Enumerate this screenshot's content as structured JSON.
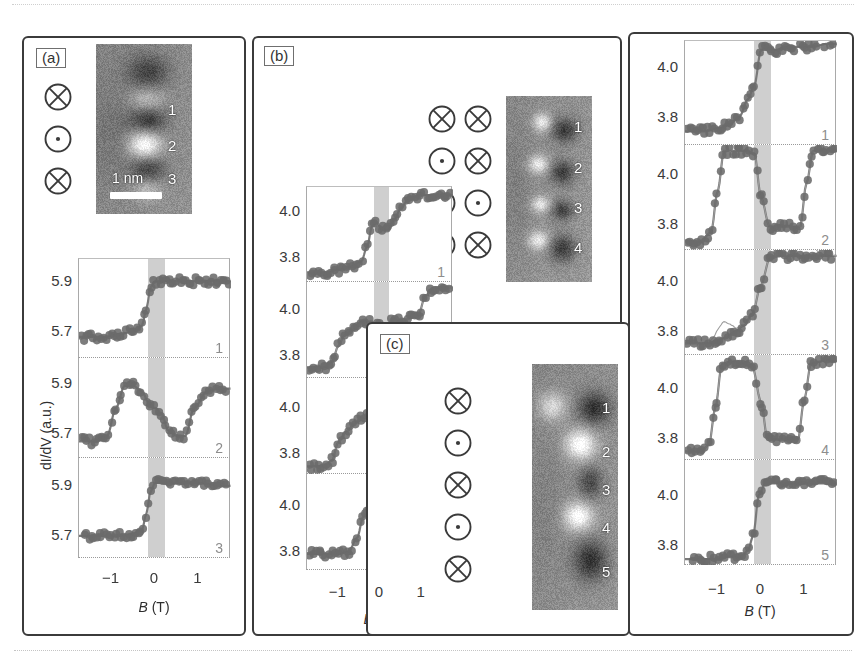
{
  "figure": {
    "background": "#ffffff",
    "data_color": "#6b6b6b",
    "band_color": "#cfcfcf",
    "curve_color": "#7a7a7a",
    "frame_color": "#3b3b3b"
  },
  "panels": [
    {
      "id": "a",
      "label": "(a)",
      "spins": [
        [
          "cross"
        ],
        [
          "dot"
        ],
        [
          "cross"
        ]
      ],
      "stm": {
        "numbers": [
          "1",
          "2",
          "3"
        ],
        "scalebar_label": "1 nm"
      },
      "axis": {
        "ylabel": "dI/dV (a.u.)",
        "yticks": [
          "5.9",
          "5.7"
        ],
        "xticks": [
          "-1",
          "0",
          "1"
        ],
        "xlabel_sym": "B",
        "xlabel_unit": "(T)"
      },
      "subplots": [
        {
          "number": "1"
        },
        {
          "number": "2"
        },
        {
          "number": "3"
        }
      ]
    },
    {
      "id": "b",
      "label": "(b)",
      "spins": [
        [
          "cross",
          "cross"
        ],
        [
          "dot",
          "cross"
        ],
        [
          "cross",
          "dot"
        ],
        [
          "cross",
          "cross"
        ]
      ],
      "stm": {
        "numbers": [
          "1",
          "2",
          "3",
          "4"
        ],
        "scalebar_label": ""
      },
      "axis": {
        "ylabel": "",
        "yticks": [
          "4.0",
          "3.8"
        ],
        "xticks": [
          "-1",
          "0",
          "1"
        ],
        "xlabel_sym": "B",
        "xlabel_unit": "(T)"
      },
      "subplots": [
        {
          "number": "1"
        },
        {
          "number": "2"
        },
        {
          "number": "3"
        },
        {
          "number": "4"
        }
      ]
    },
    {
      "id": "c",
      "label": "(c)",
      "spins": [
        [
          "cross"
        ],
        [
          "dot"
        ],
        [
          "cross"
        ],
        [
          "dot"
        ],
        [
          "cross"
        ]
      ],
      "stm": {
        "numbers": [
          "1",
          "2",
          "3",
          "4",
          "5"
        ],
        "scalebar_label": ""
      },
      "axis": {
        "ylabel": "",
        "yticks": [
          "4.0",
          "3.8"
        ],
        "xticks": [
          "-1",
          "0",
          "1"
        ],
        "xlabel_sym": "B",
        "xlabel_unit": "(T)"
      },
      "subplots": [
        {
          "number": "1"
        },
        {
          "number": "2"
        },
        {
          "number": "3"
        },
        {
          "number": "4"
        },
        {
          "number": "5"
        }
      ]
    }
  ],
  "chart_data": {
    "type": "scatter",
    "title": "",
    "xlabel": "B (T)",
    "ylabel": "dI/dV (a.u.)",
    "xlim": [
      -1.75,
      1.75
    ],
    "ylim_a": [
      5.62,
      5.98
    ],
    "ylim_bc": [
      3.72,
      4.08
    ],
    "grid": false,
    "legend": "none",
    "shaded_band_T": [
      -0.15,
      0.22
    ],
    "panels": [
      {
        "panel": "a",
        "yticks": [
          5.7,
          5.9
        ],
        "xticks": [
          -1,
          0,
          1
        ],
        "curves": [
          {
            "site": "1",
            "type": "single-step",
            "x": [
              -1.75,
              -1.2,
              -0.8,
              -0.45,
              -0.3,
              -0.2,
              -0.1,
              0.0,
              0.2,
              0.6,
              1.0,
              1.5,
              1.75
            ],
            "y": [
              5.7,
              5.7,
              5.71,
              5.72,
              5.74,
              5.8,
              5.88,
              5.9,
              5.9,
              5.9,
              5.9,
              5.9,
              5.9
            ]
          },
          {
            "site": "2",
            "type": "double-switch",
            "x": [
              -1.75,
              -1.4,
              -1.1,
              -0.9,
              -0.7,
              -0.5,
              -0.3,
              -0.15,
              0.0,
              0.15,
              0.3,
              0.5,
              0.7,
              0.9,
              1.2,
              1.5,
              1.75
            ],
            "y": [
              5.68,
              5.68,
              5.7,
              5.8,
              5.88,
              5.88,
              5.86,
              5.82,
              5.8,
              5.78,
              5.72,
              5.7,
              5.7,
              5.8,
              5.86,
              5.87,
              5.87
            ]
          },
          {
            "site": "3",
            "type": "single-step",
            "x": [
              -1.75,
              -1.2,
              -0.8,
              -0.45,
              -0.3,
              -0.2,
              -0.1,
              0.0,
              0.2,
              0.6,
              1.0,
              1.5,
              1.75
            ],
            "y": [
              5.7,
              5.7,
              5.7,
              5.71,
              5.72,
              5.78,
              5.86,
              5.89,
              5.89,
              5.89,
              5.89,
              5.88,
              5.88
            ]
          }
        ]
      },
      {
        "panel": "b",
        "yticks": [
          3.8,
          4.0
        ],
        "xticks": [
          -1,
          0,
          1
        ],
        "curves": [
          {
            "site": "1",
            "type": "two-step",
            "x": [
              -1.75,
              -1.3,
              -1.0,
              -0.7,
              -0.45,
              -0.3,
              -0.2,
              -0.1,
              0.05,
              0.2,
              0.35,
              0.5,
              0.7,
              1.0,
              1.4,
              1.75
            ],
            "y": [
              3.76,
              3.76,
              3.77,
              3.78,
              3.8,
              3.86,
              3.93,
              3.95,
              3.92,
              3.92,
              3.96,
              4.0,
              4.04,
              4.05,
              4.05,
              4.05
            ]
          },
          {
            "site": "2",
            "type": "three-step",
            "x": [
              -1.75,
              -1.35,
              -1.15,
              -1.0,
              -0.85,
              -0.65,
              -0.45,
              -0.3,
              -0.1,
              0.1,
              0.3,
              0.6,
              0.9,
              1.1,
              1.3,
              1.5,
              1.75
            ],
            "y": [
              3.76,
              3.76,
              3.78,
              3.84,
              3.88,
              3.9,
              3.93,
              3.93,
              3.92,
              3.92,
              3.93,
              3.94,
              3.95,
              4.03,
              4.06,
              4.06,
              4.06
            ]
          },
          {
            "site": "3",
            "type": "three-step",
            "x": [
              -1.75,
              -1.35,
              -1.15,
              -1.0,
              -0.8,
              -0.6,
              -0.4,
              -0.2,
              0.0,
              0.25,
              0.5,
              0.75,
              1.0,
              1.2,
              1.45,
              1.75
            ],
            "y": [
              3.75,
              3.75,
              3.77,
              3.84,
              3.88,
              3.91,
              3.93,
              3.94,
              3.94,
              3.95,
              3.96,
              3.98,
              4.02,
              4.05,
              4.06,
              4.06
            ]
          },
          {
            "site": "4",
            "type": "step-dip-step",
            "x": [
              -1.75,
              -1.3,
              -1.0,
              -0.75,
              -0.55,
              -0.4,
              -0.25,
              -0.1,
              0.05,
              0.2,
              0.35,
              0.55,
              0.8,
              1.1,
              1.4,
              1.75
            ],
            "y": [
              3.78,
              3.78,
              3.78,
              3.79,
              3.84,
              3.92,
              3.94,
              3.9,
              3.88,
              3.9,
              3.96,
              4.01,
              4.03,
              4.04,
              4.05,
              4.05
            ]
          }
        ]
      },
      {
        "panel": "c",
        "yticks": [
          3.8,
          4.0
        ],
        "xticks": [
          -1,
          0,
          1
        ],
        "curves": [
          {
            "site": "1",
            "type": "ramp-step",
            "x": [
              -1.75,
              -1.3,
              -1.0,
              -0.75,
              -0.5,
              -0.3,
              -0.15,
              0.0,
              0.15,
              0.35,
              0.6,
              0.9,
              1.2,
              1.5,
              1.75
            ],
            "y": [
              3.77,
              3.77,
              3.78,
              3.79,
              3.82,
              3.88,
              3.93,
              4.05,
              4.05,
              4.05,
              4.06,
              4.06,
              4.06,
              4.07,
              4.07
            ]
          },
          {
            "site": "2",
            "type": "plateau-dip-plateau",
            "x": [
              -1.75,
              -1.4,
              -1.15,
              -1.0,
              -0.85,
              -0.6,
              -0.35,
              -0.15,
              0.0,
              0.2,
              0.4,
              0.65,
              0.9,
              1.05,
              1.2,
              1.5,
              1.75
            ],
            "y": [
              3.75,
              3.75,
              3.78,
              3.92,
              4.06,
              4.06,
              4.06,
              4.05,
              3.9,
              3.8,
              3.8,
              3.8,
              3.8,
              3.95,
              4.06,
              4.06,
              4.06
            ]
          },
          {
            "site": "3",
            "type": "ramp-step-secondary",
            "x": [
              -1.75,
              -1.4,
              -1.2,
              -1.0,
              -0.8,
              -0.6,
              -0.4,
              -0.2,
              0.0,
              0.2,
              0.45,
              0.7,
              1.0,
              1.3,
              1.6,
              1.75
            ],
            "y": [
              3.76,
              3.76,
              3.76,
              3.77,
              3.78,
              3.8,
              3.82,
              3.86,
              3.96,
              4.05,
              4.06,
              4.06,
              4.06,
              4.06,
              4.06,
              4.06
            ]
          },
          {
            "site": "4",
            "type": "plateau-dip-plateau",
            "x": [
              -1.75,
              -1.4,
              -1.2,
              -1.05,
              -0.9,
              -0.65,
              -0.4,
              -0.2,
              0.0,
              0.15,
              0.35,
              0.6,
              0.85,
              1.0,
              1.15,
              1.45,
              1.75
            ],
            "y": [
              3.75,
              3.75,
              3.77,
              3.9,
              4.05,
              4.06,
              4.05,
              4.04,
              3.92,
              3.79,
              3.79,
              3.79,
              3.79,
              3.93,
              4.05,
              4.06,
              4.06
            ]
          },
          {
            "site": "5",
            "type": "single-step",
            "x": [
              -1.75,
              -1.3,
              -1.0,
              -0.7,
              -0.45,
              -0.3,
              -0.18,
              -0.05,
              0.1,
              0.3,
              0.6,
              0.9,
              1.2,
              1.5,
              1.75
            ],
            "y": [
              3.74,
              3.74,
              3.74,
              3.75,
              3.75,
              3.77,
              3.82,
              3.96,
              4.0,
              4.0,
              4.0,
              4.0,
              4.0,
              4.0,
              4.0
            ]
          }
        ]
      }
    ]
  }
}
